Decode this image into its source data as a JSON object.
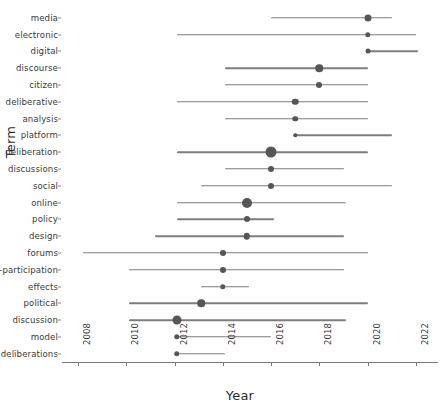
{
  "chart_data": {
    "type": "scatter",
    "title": "",
    "xlabel": "Year",
    "ylabel": "Term",
    "xlim": [
      2007.3,
      2022.4
    ],
    "xticks": [
      2008,
      2010,
      2012,
      2014,
      2016,
      2018,
      2020,
      2022
    ],
    "xtick_labels": [
      "2008",
      "2010",
      "2012",
      "2014",
      "2016",
      "2018",
      "2020",
      "2022"
    ],
    "grid": false,
    "legend": null,
    "note": "Dot = central year (point estimate); horizontal bar = year range; dot area encodes term frequency/weight.",
    "categories": [
      "media",
      "electronic",
      "digital",
      "discourse",
      "citizen",
      "deliberative",
      "analysis",
      "platform",
      "deliberation",
      "discussions",
      "social",
      "online",
      "policy",
      "design",
      "forums",
      "e-participation",
      "effects",
      "political",
      "discussion",
      "model",
      "deliberations"
    ],
    "points": [
      {
        "term": "media",
        "year": 2020.0,
        "start": 2016.0,
        "end": 2021.0,
        "size": 7.0
      },
      {
        "term": "electronic",
        "year": 2020.0,
        "start": 2012.1,
        "end": 2022.0,
        "size": 5.5
      },
      {
        "term": "digital",
        "year": 2020.0,
        "start": 2020.0,
        "end": 2022.1,
        "size": 5.0
      },
      {
        "term": "discourse",
        "year": 2018.0,
        "start": 2014.1,
        "end": 2020.0,
        "size": 7.5
      },
      {
        "term": "citizen",
        "year": 2018.0,
        "start": 2014.1,
        "end": 2020.0,
        "size": 6.0
      },
      {
        "term": "deliberative",
        "year": 2017.0,
        "start": 2012.1,
        "end": 2020.0,
        "size": 6.5
      },
      {
        "term": "analysis",
        "year": 2017.0,
        "start": 2014.1,
        "end": 2020.0,
        "size": 5.5
      },
      {
        "term": "platform",
        "year": 2017.0,
        "start": 2017.0,
        "end": 2021.0,
        "size": 3.5
      },
      {
        "term": "deliberation",
        "year": 2016.0,
        "start": 2012.1,
        "end": 2020.0,
        "size": 11.0
      },
      {
        "term": "discussions",
        "year": 2016.0,
        "start": 2014.1,
        "end": 2019.0,
        "size": 6.0
      },
      {
        "term": "social",
        "year": 2016.0,
        "start": 2013.1,
        "end": 2021.0,
        "size": 6.0
      },
      {
        "term": "online",
        "year": 2015.0,
        "start": 2012.1,
        "end": 2019.1,
        "size": 10.0
      },
      {
        "term": "policy",
        "year": 2015.0,
        "start": 2012.1,
        "end": 2016.1,
        "size": 6.0
      },
      {
        "term": "design",
        "year": 2015.0,
        "start": 2011.2,
        "end": 2019.0,
        "size": 6.5
      },
      {
        "term": "forums",
        "year": 2014.0,
        "start": 2008.2,
        "end": 2020.0,
        "size": 6.0
      },
      {
        "term": "e-participation",
        "year": 2014.0,
        "start": 2010.1,
        "end": 2019.0,
        "size": 6.0
      },
      {
        "term": "effects",
        "year": 2014.0,
        "start": 2013.1,
        "end": 2015.1,
        "size": 5.5
      },
      {
        "term": "political",
        "year": 2013.1,
        "start": 2010.1,
        "end": 2020.0,
        "size": 7.5
      },
      {
        "term": "discussion",
        "year": 2012.1,
        "start": 2010.1,
        "end": 2019.1,
        "size": 9.0
      },
      {
        "term": "model",
        "year": 2012.1,
        "start": 2012.1,
        "end": 2016.0,
        "size": 5.5
      },
      {
        "term": "deliberations",
        "year": 2012.1,
        "start": 2012.1,
        "end": 2014.1,
        "size": 5.5
      }
    ],
    "colors": {
      "dot": "#565656",
      "line": "#7d7d7d",
      "axis": "#7a7a7a",
      "text": "#3a3a3a",
      "background": "#ffffff"
    }
  }
}
